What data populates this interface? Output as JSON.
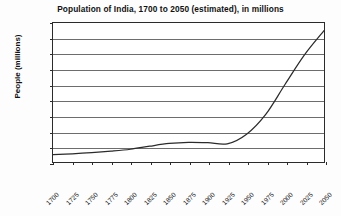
{
  "chart_data": {
    "type": "line",
    "title": "Population of India, 1700 to 2050 (estimated), in millions",
    "xlabel": "",
    "ylabel": "People (millions)",
    "xlim": [
      1700,
      2050
    ],
    "ylim": [
      0,
      1800
    ],
    "grid": true,
    "legend": "none",
    "xticks": [
      1700,
      1725,
      1750,
      1775,
      1800,
      1825,
      1850,
      1875,
      1900,
      1925,
      1950,
      1975,
      2000,
      2025,
      2050
    ],
    "yticks": [
      0,
      200,
      400,
      600,
      800,
      1000,
      1200,
      1400,
      1600,
      1800
    ],
    "series": [
      {
        "name": "Population of India",
        "color": "#2b2b2b",
        "x": [
          1700,
          1725,
          1750,
          1775,
          1800,
          1825,
          1850,
          1875,
          1900,
          1925,
          1950,
          1975,
          2000,
          2025,
          2050
        ],
        "values": [
          95,
          105,
          120,
          140,
          165,
          205,
          240,
          255,
          250,
          235,
          360,
          620,
          1010,
          1390,
          1700
        ]
      }
    ]
  },
  "axis": {
    "y_label_text": "People (millions)"
  }
}
